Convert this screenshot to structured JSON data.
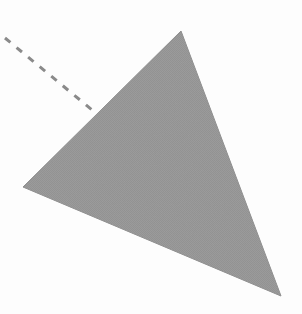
{
  "canvas": {
    "width": 302,
    "height": 314,
    "background_color": "#fdfdfd",
    "title": "Triangle with dashed line"
  },
  "figure": {
    "name": "shaded-triangle-with-dashed-ray",
    "shapes": [
      {
        "id": "triangle",
        "type": "polygon",
        "label": "shaded triangle",
        "vertices": [
          {
            "name": "apex",
            "x": 181,
            "y": 31
          },
          {
            "name": "bottom-right",
            "x": 281,
            "y": 296
          },
          {
            "name": "left",
            "x": 23,
            "y": 187
          }
        ],
        "points_attr": "181,31 281,296 23,187",
        "fill_color": "#969696",
        "fill_pattern": "halftone-dither",
        "stroke_color": "#8e8e8e",
        "stroke_width": 1
      },
      {
        "id": "dashed-line",
        "type": "line",
        "label": "dashed construction line",
        "start": {
          "x": 5,
          "y": 38
        },
        "end": {
          "x": 97,
          "y": 114
        },
        "stroke_color": "#8a8a8a",
        "stroke_width": 3,
        "dash_length": 7,
        "gap_length": 8,
        "dash_array": "7 8"
      }
    ]
  },
  "chart_data": {
    "type": "diagram",
    "xlabel": "",
    "ylabel": "",
    "annotations": [],
    "legend": [],
    "grid": false,
    "elements": [
      {
        "kind": "polygon",
        "name": "triangle",
        "points": [
          [
            181,
            31
          ],
          [
            281,
            296
          ],
          [
            23,
            187
          ]
        ],
        "fill": "#969696"
      },
      {
        "kind": "line",
        "name": "dashed-line",
        "points": [
          [
            5,
            38
          ],
          [
            97,
            114
          ]
        ],
        "style": "dashed",
        "stroke": "#8a8a8a"
      }
    ]
  }
}
